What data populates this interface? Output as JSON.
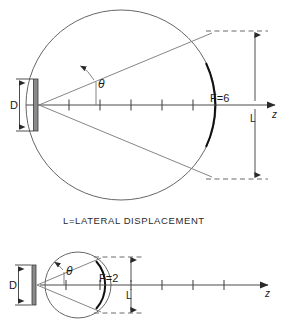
{
  "figure": {
    "caption": "L=LATERAL DISPLACEMENT",
    "panels": [
      {
        "id": "upper",
        "f_label": "F=6",
        "d_label": "D",
        "l_label": "L",
        "z_label": "z",
        "theta_label": "θ",
        "axis_ticks": 5,
        "circle": {
          "cx": 121,
          "cy": 105,
          "r": 95
        },
        "arc_thick": true,
        "ray_count": 2
      },
      {
        "id": "lower",
        "f_label": "F=2",
        "d_label": "D",
        "l_label": "L",
        "z_label": "z",
        "theta_label": "θ",
        "axis_ticks": 6,
        "circle": {
          "cx": 78,
          "cy": 285,
          "r": 33
        },
        "arc_thick": true,
        "ray_count": 2
      }
    ],
    "colors": {
      "background": "#ffffff",
      "line": "#555555",
      "arc": "#111111",
      "text": "#1a1a1a",
      "dashed": "#6a6a6a",
      "plate": "#8a8a8a"
    }
  }
}
